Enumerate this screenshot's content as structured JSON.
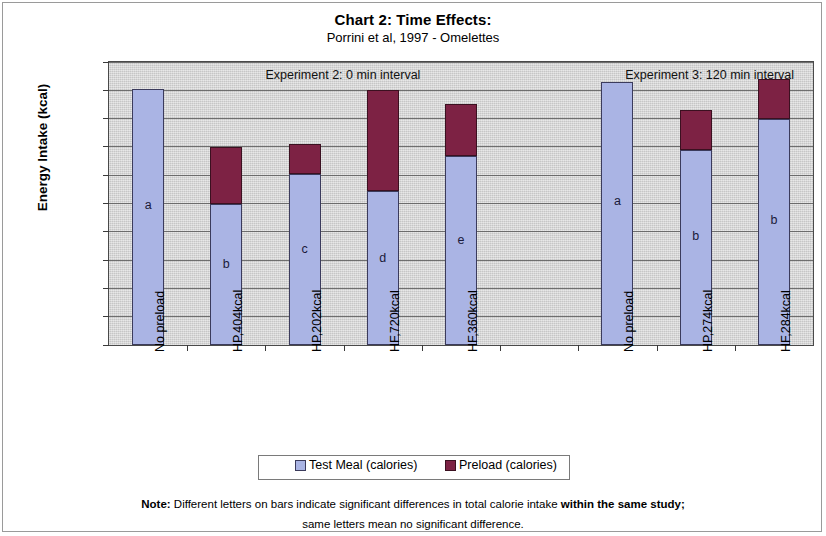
{
  "title": "Chart 2: Time Effects:",
  "subtitle": "Porrini et al, 1997 - Omelettes",
  "legend": {
    "test_label": "Test Meal (calories)",
    "preload_label": "Preload (calories)"
  },
  "note": {
    "line1_bold_lead": "Note:",
    "line1_mid": " Different letters on bars indicate significant differences in total calorie intake ",
    "line1_bold_tail": "within the same study;",
    "line2": "same letters mean no significant difference."
  },
  "colors": {
    "test_meal": "#aab4e4",
    "preload": "#7d2244",
    "plot_background": "#d3d3d3",
    "gridline": "#5a5a5a",
    "page_background": "#ffffff"
  },
  "chart_data": {
    "type": "bar",
    "subtype": "stacked",
    "title": "Chart 2: Time Effects:",
    "subtitle": "Porrini et al, 1997 - Omelettes",
    "xlabel": "",
    "ylabel": "Energy Intake (kcal)",
    "ylim": [
      0,
      2000
    ],
    "ytick_step": 200,
    "yticks": [
      0,
      200,
      400,
      600,
      800,
      1000,
      1200,
      1400,
      1600,
      1800,
      2000
    ],
    "grid": true,
    "legend_position": "bottom",
    "categories": [
      "No preload",
      "HP,404kcal",
      "HP,202kcal",
      "HF,720kcal",
      "HF,360kcal",
      "",
      "No preload",
      "HP,274kcal",
      "HF,284kcal"
    ],
    "series": [
      {
        "name": "Test Meal (calories)",
        "color": "#aab4e4",
        "values": [
          1810,
          1000,
          1210,
          1085,
          1335,
          null,
          1860,
          1380,
          1600
        ]
      },
      {
        "name": "Preload (calories)",
        "color": "#7d2244",
        "values": [
          0,
          400,
          210,
          720,
          365,
          null,
          0,
          280,
          280
        ]
      }
    ],
    "totals": [
      1810,
      1400,
      1420,
      1805,
      1700,
      null,
      1860,
      1660,
      1880
    ],
    "bar_letters": [
      "a",
      "b",
      "c",
      "d",
      "e",
      "",
      "a",
      "b",
      "b"
    ],
    "annotations": [
      {
        "text": "Experiment 2: 0 min interval",
        "value_x": 2.0,
        "value_y": 1900
      },
      {
        "text": "Experiment 3: 120 min interval",
        "value_x": 6.6,
        "value_y": 1900
      }
    ]
  }
}
